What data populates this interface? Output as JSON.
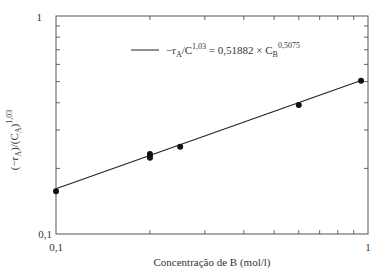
{
  "chart_data": {
    "type": "scatter",
    "title": "",
    "xlabel": "Concentração de B (mol/l)",
    "ylabel": "(−r_A)/(C_A)^1,03",
    "xscale": "log",
    "yscale": "log",
    "xlim": [
      0.1,
      1
    ],
    "ylim": [
      0.1,
      1
    ],
    "x_ticks": [
      "0,1",
      "1"
    ],
    "y_ticks": [
      "0,1",
      "1"
    ],
    "grid": false,
    "series": [
      {
        "name": "data",
        "type": "scatter",
        "x": [
          0.1,
          0.2,
          0.2,
          0.2,
          0.25,
          0.6,
          0.95
        ],
        "y": [
          0.157,
          0.233,
          0.228,
          0.224,
          0.251,
          0.391,
          0.504
        ]
      },
      {
        "name": "−r_A/C^1,03 = 0,51882 × C_B^0,5075",
        "type": "line",
        "coef": 0.51882,
        "exponent": 0.5075,
        "x": [
          0.1,
          0.95
        ]
      }
    ],
    "legend": {
      "position": "top-center",
      "entry": "−r_A/C^1,03 = 0,51882 × C_B^0,5075"
    }
  },
  "legend_text": {
    "lhs_main": "−r",
    "lhs_sub": "A",
    "lhs_slash": "/C",
    "lhs_sup": "1,03",
    "eq": " = 0,51882 × C",
    "rhs_sub": "B",
    "rhs_sup": "0,5075"
  },
  "ylabel_parts": {
    "p1": "(−r",
    "s1": "A",
    "p2": ")/(C",
    "s2": "A",
    "p3": ")",
    "sup": "1,03"
  }
}
